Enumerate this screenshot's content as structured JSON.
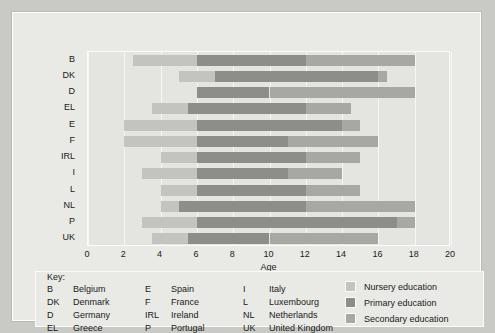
{
  "chart_data": {
    "type": "bar",
    "orientation": "horizontal",
    "stacked": true,
    "title": "",
    "xlabel": "Age",
    "ylabel": "",
    "xlim": [
      0,
      20
    ],
    "xticks": [
      0,
      2,
      4,
      6,
      8,
      10,
      12,
      14,
      16,
      18,
      20
    ],
    "grid": true,
    "legend_position": "bottom-right",
    "categories": [
      "B",
      "DK",
      "D",
      "EL",
      "E",
      "F",
      "IRL",
      "I",
      "L",
      "NL",
      "P",
      "UK"
    ],
    "series": [
      {
        "name": "Nursery education",
        "color": "#c3c3bf",
        "ranges": [
          [
            2.5,
            6.0
          ],
          [
            5.0,
            7.0
          ],
          [
            null,
            null
          ],
          [
            3.5,
            5.5
          ],
          [
            2.0,
            6.0
          ],
          [
            2.0,
            6.0
          ],
          [
            4.0,
            6.0
          ],
          [
            3.0,
            6.0
          ],
          [
            4.0,
            6.0
          ],
          [
            4.0,
            5.0
          ],
          [
            3.0,
            6.0
          ],
          [
            3.5,
            5.5
          ]
        ]
      },
      {
        "name": "Primary education",
        "color": "#8e8e89",
        "ranges": [
          [
            6.0,
            12.0
          ],
          [
            7.0,
            16.0
          ],
          [
            6.0,
            10.0
          ],
          [
            5.5,
            12.0
          ],
          [
            6.0,
            14.0
          ],
          [
            6.0,
            11.0
          ],
          [
            6.0,
            12.0
          ],
          [
            6.0,
            11.0
          ],
          [
            6.0,
            12.0
          ],
          [
            5.0,
            12.0
          ],
          [
            6.0,
            17.0
          ],
          [
            5.5,
            10.0
          ]
        ]
      },
      {
        "name": "Secondary education",
        "color": "#a8a8a3",
        "ranges": [
          [
            12.0,
            18.0
          ],
          [
            16.0,
            16.5
          ],
          [
            10.0,
            18.0
          ],
          [
            12.0,
            14.5
          ],
          [
            14.0,
            15.0
          ],
          [
            11.0,
            16.0
          ],
          [
            12.0,
            15.0
          ],
          [
            11.0,
            14.0
          ],
          [
            12.0,
            15.0
          ],
          [
            12.0,
            18.0
          ],
          [
            17.0,
            18.0
          ],
          [
            10.0,
            16.0
          ]
        ]
      }
    ]
  },
  "axis": {
    "x_title": "Age",
    "tick_labels": [
      "0",
      "2",
      "4",
      "6",
      "8",
      "10",
      "12",
      "14",
      "16",
      "18",
      "20"
    ]
  },
  "key": {
    "heading": "Key:",
    "abbreviations": [
      [
        {
          "code": "B",
          "name": "Belgium"
        },
        {
          "code": "E",
          "name": "Spain"
        },
        {
          "code": "I",
          "name": "Italy"
        }
      ],
      [
        {
          "code": "DK",
          "name": "Denmark"
        },
        {
          "code": "F",
          "name": "France"
        },
        {
          "code": "L",
          "name": "Luxembourg"
        }
      ],
      [
        {
          "code": "D",
          "name": "Germany"
        },
        {
          "code": "IRL",
          "name": "Ireland"
        },
        {
          "code": "NL",
          "name": "Netherlands"
        }
      ],
      [
        {
          "code": "EL",
          "name": "Greece"
        },
        {
          "code": "P",
          "name": "Portugal"
        },
        {
          "code": "UK",
          "name": "United Kingdom"
        }
      ]
    ],
    "legend": [
      {
        "label": "Nursery education",
        "color": "#c3c3bf"
      },
      {
        "label": "Primary education",
        "color": "#8e8e89"
      },
      {
        "label": "Secondary education",
        "color": "#a8a8a3"
      }
    ]
  }
}
